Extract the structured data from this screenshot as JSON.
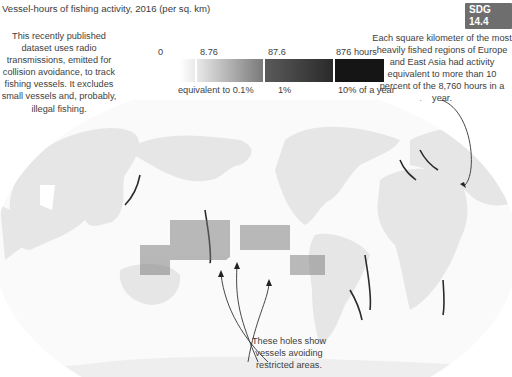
{
  "header": {
    "clipped_title": "...hed across significant...",
    "subtitle": "Vessel-hours of fishing activity, 2016 (per sq. km)",
    "badge": "SDG 14.4"
  },
  "notes": {
    "left": "This recently published dataset uses radio transmissions, emitted for collision avoidance, to track fishing vessels. It excludes small vessels and, probably, illegal fishing.",
    "right": "Each square kilometer of the most heavily fished regions of Europe and East Asia had activity equivalent to more than 10 percent of the 8,760 hours in a year.",
    "bottom": "These holes show vessels avoiding restricted areas."
  },
  "legend": {
    "top_ticks": [
      "0",
      "8.76",
      "87.6",
      "876 hours"
    ],
    "bottom_ticks": [
      "equivalent to 0.1%",
      "1%",
      "10% of a year"
    ],
    "colors": [
      "#ffffff",
      "#b0b0b0",
      "#3a3a3a",
      "#151515"
    ]
  },
  "map": {
    "land_color": "#e6e6e6",
    "ocean_color": "#ffffff",
    "fishing_color": "#222222",
    "highlighted_regions": [
      "East Asia",
      "Europe",
      "Pacific restricted-area holes"
    ]
  }
}
